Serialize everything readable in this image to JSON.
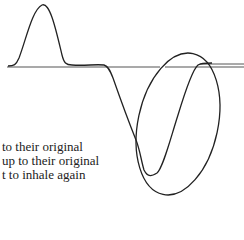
{
  "diagram": {
    "type": "breathing-waveform",
    "annotation": "ellipse-highlight-around-recovery"
  },
  "caption_lines": [
    "to their original",
    "up to their original",
    "t to inhale again"
  ]
}
